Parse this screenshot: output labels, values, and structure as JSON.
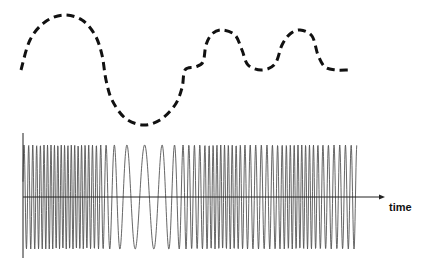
{
  "diagram": {
    "axis_label": "time",
    "colors": {
      "background": "#ffffff",
      "modulating_signal": "#111111",
      "carrier_wave": "#555555",
      "axis": "#222222"
    },
    "modulating_signal": {
      "style": "dashed",
      "points": [
        [
          21,
          70
        ],
        [
          30,
          40
        ],
        [
          45,
          22
        ],
        [
          64,
          15
        ],
        [
          82,
          20
        ],
        [
          95,
          35
        ],
        [
          102,
          55
        ],
        [
          106,
          80
        ],
        [
          112,
          100
        ],
        [
          125,
          118
        ],
        [
          143,
          125
        ],
        [
          160,
          120
        ],
        [
          175,
          105
        ],
        [
          182,
          88
        ],
        [
          185,
          70
        ],
        [
          195,
          67
        ],
        [
          203,
          62
        ],
        [
          206,
          45
        ],
        [
          212,
          34
        ],
        [
          222,
          30
        ],
        [
          235,
          35
        ],
        [
          242,
          50
        ],
        [
          248,
          65
        ],
        [
          262,
          70
        ],
        [
          275,
          64
        ],
        [
          282,
          45
        ],
        [
          290,
          34
        ],
        [
          300,
          30
        ],
        [
          312,
          36
        ],
        [
          318,
          55
        ],
        [
          325,
          67
        ],
        [
          336,
          70
        ],
        [
          348,
          70
        ]
      ]
    },
    "carrier_wave": {
      "x_start": 23,
      "x_end": 357,
      "center_y": 197,
      "amplitude": 52,
      "min_frequency_cycles_per_px": 0.05,
      "max_frequency_cycles_per_px": 0.3
    },
    "axes": {
      "vertical": {
        "x": 23,
        "y_top": 133,
        "y_bottom": 258
      },
      "horizontal": {
        "y": 197,
        "x_start": 23,
        "x_end": 385
      }
    },
    "label_position": {
      "x": 389,
      "y": 211
    }
  }
}
